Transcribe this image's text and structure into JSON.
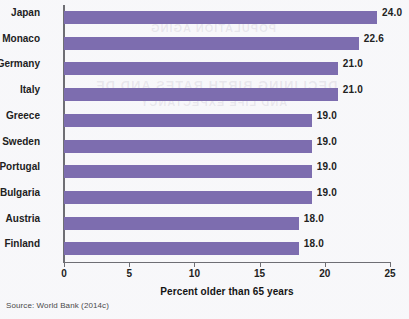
{
  "chart_data": {
    "type": "bar",
    "orientation": "horizontal",
    "title": "",
    "xlabel": "Percent older than 65 years",
    "ylabel": "",
    "xlim": [
      0,
      25
    ],
    "xticks": [
      0,
      5,
      10,
      15,
      20,
      25
    ],
    "grid": false,
    "legend": null,
    "bar_color": "#7d6daf",
    "categories": [
      "Japan",
      "Monaco",
      "Germany",
      "Italy",
      "Greece",
      "Sweden",
      "Portugal",
      "Bulgaria",
      "Austria",
      "Finland"
    ],
    "values": [
      24.0,
      22.6,
      21.0,
      21.0,
      19.0,
      19.0,
      19.0,
      19.0,
      18.0,
      18.0
    ],
    "value_labels": [
      "24.0",
      "22.6",
      "21.0",
      "21.0",
      "19.0",
      "19.0",
      "19.0",
      "19.0",
      "18.0",
      "18.0"
    ]
  },
  "source_note": "Source: World Bank (2014c)",
  "bleed_ghosts": [
    "POPULATION AGING",
    "CHANGING BIRTH RATES",
    "DECLINING BIRTH RATES AND DE",
    "AND LIFE EXPECTANCY"
  ]
}
